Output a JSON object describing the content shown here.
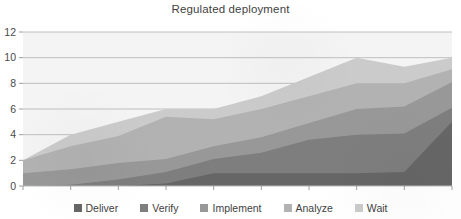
{
  "chart_data": {
    "type": "area",
    "stacked": true,
    "title": "Regulated deployment",
    "xlabel": "",
    "ylabel": "",
    "x": [
      1,
      2,
      3,
      4,
      5,
      6,
      7,
      8,
      9,
      10
    ],
    "xlim": [
      1,
      10
    ],
    "ylim": [
      0,
      12
    ],
    "ytick_labels": [
      "0",
      "2",
      "4",
      "6",
      "8",
      "10",
      "12"
    ],
    "yticks": [
      0,
      2,
      4,
      6,
      8,
      10,
      12
    ],
    "xtick_labels": [
      "1",
      "2",
      "3",
      "4",
      "5",
      "6",
      "7",
      "8",
      "9",
      "10"
    ],
    "grid": true,
    "legend_position": "bottom",
    "series": [
      {
        "name": "Deliver",
        "color": "#666666",
        "values": [
          0,
          0,
          0,
          0.2,
          1.0,
          1.0,
          1.0,
          1.0,
          1.1,
          5.0
        ]
      },
      {
        "name": "Verify",
        "color": "#7e7e7e",
        "values": [
          0,
          0.1,
          0.5,
          0.9,
          1.1,
          1.6,
          2.6,
          3.0,
          3.0,
          1.1
        ]
      },
      {
        "name": "Implement",
        "color": "#989898",
        "values": [
          1.0,
          1.2,
          1.3,
          1.0,
          1.0,
          1.2,
          1.3,
          2.0,
          2.1,
          2.0
        ]
      },
      {
        "name": "Analyze",
        "color": "#b2b2b2",
        "values": [
          1.0,
          1.8,
          2.1,
          3.3,
          2.1,
          2.2,
          2.1,
          2.0,
          1.8,
          1.0
        ]
      },
      {
        "name": "Wait",
        "color": "#cbcbcb",
        "values": [
          0,
          0.9,
          1.1,
          0.6,
          0.8,
          1.0,
          1.5,
          2.0,
          1.3,
          0.9
        ]
      }
    ],
    "totals": [
      2.0,
      4.0,
      5.0,
      6.0,
      6.0,
      7.0,
      8.5,
      10.0,
      9.3,
      10.0
    ]
  },
  "legend": {
    "items": [
      {
        "label": "Deliver",
        "color": "#666666"
      },
      {
        "label": "Verify",
        "color": "#7e7e7e"
      },
      {
        "label": "Implement",
        "color": "#989898"
      },
      {
        "label": "Analyze",
        "color": "#b2b2b2"
      },
      {
        "label": "Wait",
        "color": "#cbcbcb"
      }
    ]
  }
}
